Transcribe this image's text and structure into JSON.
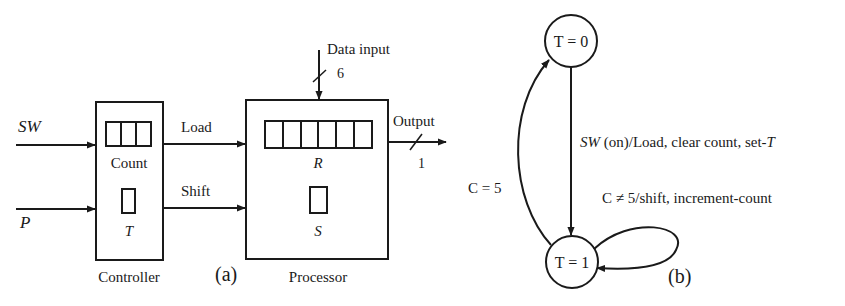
{
  "figure_a": {
    "caption": "(a)",
    "controller": {
      "label": "Controller",
      "inputs": [
        {
          "label": "SW"
        },
        {
          "label": "P"
        }
      ],
      "count_register": {
        "label": "Count",
        "cells": 3
      },
      "t_flipflop": {
        "label": "T"
      }
    },
    "signals": [
      {
        "label": "Load"
      },
      {
        "label": "Shift"
      }
    ],
    "processor": {
      "label": "Processor",
      "data_input": {
        "label": "Data input",
        "width": "6"
      },
      "output": {
        "label": "Output",
        "width": "1"
      },
      "r_register": {
        "label": "R",
        "cells": 6
      },
      "s_flipflop": {
        "label": "S"
      }
    }
  },
  "figure_b": {
    "caption": "(b)",
    "states": [
      {
        "label": "T = 0"
      },
      {
        "label": "T = 1"
      }
    ],
    "transitions": [
      {
        "from": "T = 0",
        "to": "T = 1",
        "label_italic": "SW",
        "label_rest": " (on)/Load, clear count, set-",
        "label_tail_italic": "T"
      },
      {
        "from": "T = 1",
        "to": "T = 1",
        "label": "C ≠ 5/shift, increment-count"
      },
      {
        "from": "T = 1",
        "to": "T = 0",
        "label": "C = 5"
      }
    ]
  }
}
